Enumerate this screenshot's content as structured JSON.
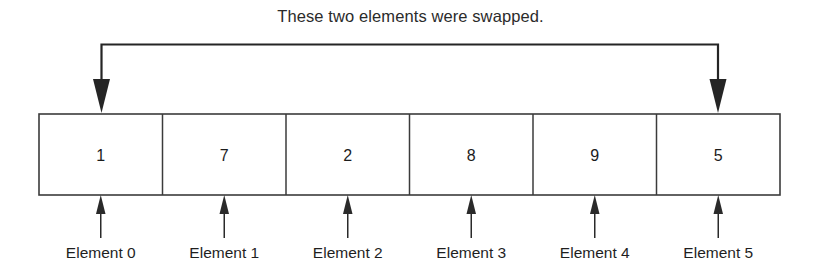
{
  "diagram": {
    "caption": "These two elements were swapped.",
    "array": {
      "cells": [
        {
          "value": "1",
          "label": "Element 0"
        },
        {
          "value": "7",
          "label": "Element 1"
        },
        {
          "value": "2",
          "label": "Element 2"
        },
        {
          "value": "8",
          "label": "Element 3"
        },
        {
          "value": "9",
          "label": "Element 4"
        },
        {
          "value": "5",
          "label": "Element 5"
        }
      ]
    },
    "swap_highlight": {
      "from_index": "0",
      "to_index": "5"
    },
    "colors": {
      "background": "#ffffff",
      "box_stroke": "#3b3b3b",
      "arrow": "#252525",
      "text": "#1c1c1c"
    }
  }
}
